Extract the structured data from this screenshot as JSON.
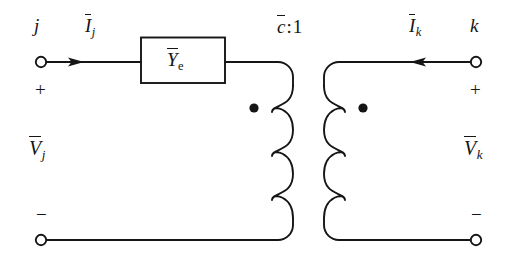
{
  "figure": {
    "type": "circuit-diagram",
    "stroke_color": "#151515",
    "background_color": "#ffffff"
  },
  "labels": {
    "node_left": "j",
    "node_right": "k",
    "current_left": {
      "symbol": "I",
      "subscript": "j",
      "overbar": true
    },
    "current_right": {
      "symbol": "I",
      "subscript": "k",
      "overbar": true
    },
    "voltage_left": {
      "symbol": "V",
      "subscript": "j",
      "overbar": true
    },
    "voltage_right": {
      "symbol": "V",
      "subscript": "k",
      "overbar": true
    },
    "admittance": {
      "symbol": "Y",
      "subscript": "e",
      "overbar": true
    },
    "turns_ratio": {
      "symbol": "c",
      "overbar": true,
      "separator": ":",
      "secondary": "1"
    },
    "polarity_plus_left": "+",
    "polarity_minus_left": "−",
    "polarity_plus_right": "+",
    "polarity_minus_right": "−"
  },
  "elements": {
    "terminal_top_left": "open-circle-terminal",
    "terminal_bottom_left": "open-circle-terminal",
    "terminal_top_right": "open-circle-terminal",
    "terminal_bottom_right": "open-circle-terminal",
    "admittance_box": "rectangle-element",
    "primary_winding": "coil-3-loops",
    "secondary_winding": "coil-3-loops",
    "primary_dot": "polarity-dot",
    "secondary_dot": "polarity-dot",
    "arrow_left": "current-arrow-right",
    "arrow_right": "current-arrow-left"
  }
}
